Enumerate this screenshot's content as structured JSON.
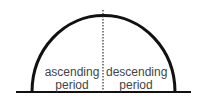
{
  "diagram": {
    "left_label_line1": "ascending",
    "left_label_line2": "period",
    "right_label_line1": "descending",
    "right_label_line2": "period",
    "colors": {
      "stroke": "#111111",
      "text": "#444444"
    }
  }
}
